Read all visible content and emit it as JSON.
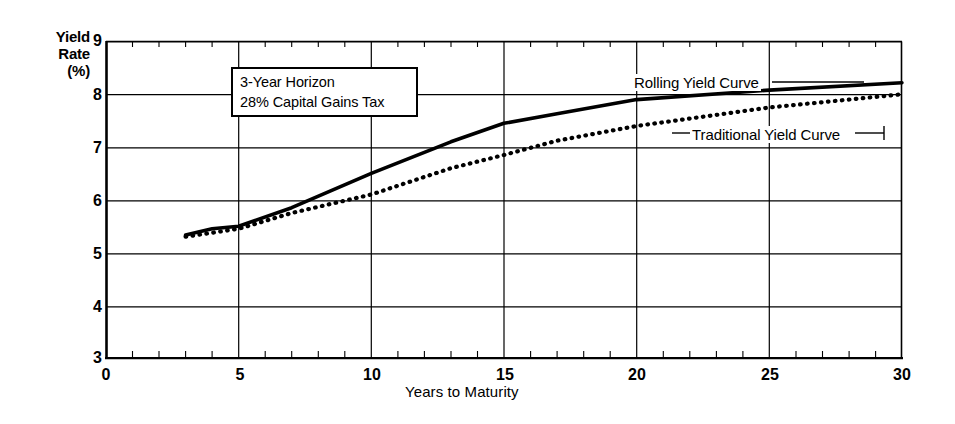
{
  "chart_data": {
    "type": "line",
    "title": "",
    "xlabel": "Years to Maturity",
    "ylabel": "Yield Rate (%)",
    "ylabel_lines": [
      "Yield",
      "Rate",
      "(%)"
    ],
    "xlim": [
      0,
      30
    ],
    "ylim": [
      3,
      9
    ],
    "xticks": [
      0,
      5,
      10,
      15,
      20,
      25,
      30
    ],
    "xtick_labels": [
      "0",
      "5",
      "10",
      "15",
      "20",
      "25",
      "30"
    ],
    "yticks": [
      3,
      4,
      5,
      6,
      7,
      8,
      9
    ],
    "ytick_labels": [
      "3",
      "4",
      "5",
      "6",
      "7",
      "8",
      "9"
    ],
    "x_minor_tick_step": 1,
    "grid": "both",
    "legend_position": "inline-labels",
    "series": [
      {
        "name": "Rolling Yield Curve",
        "style": "solid",
        "x": [
          3,
          4,
          5,
          7,
          10,
          13,
          15,
          17,
          20,
          25,
          30
        ],
        "y": [
          5.33,
          5.45,
          5.5,
          5.85,
          6.5,
          7.1,
          7.45,
          7.63,
          7.9,
          8.08,
          8.22
        ]
      },
      {
        "name": "Traditional Yield Curve",
        "style": "dotted",
        "x": [
          3,
          5,
          7,
          10,
          13,
          15,
          17,
          20,
          25,
          30
        ],
        "y": [
          5.3,
          5.45,
          5.75,
          6.1,
          6.6,
          6.85,
          7.12,
          7.4,
          7.75,
          8.0
        ]
      }
    ],
    "annotations": [
      {
        "name": "assumptions-box",
        "lines": [
          "3-Year Horizon",
          "28% Capital Gains Tax"
        ]
      }
    ],
    "series_labels": [
      {
        "name": "rolling-yield-curve-label",
        "text": "Rolling Yield Curve"
      },
      {
        "name": "traditional-yield-curve-label",
        "text": "Traditional Yield Curve"
      }
    ],
    "colors": {
      "line": "#000000",
      "grid": "#000000",
      "background": "#ffffff",
      "text": "#000000"
    }
  }
}
